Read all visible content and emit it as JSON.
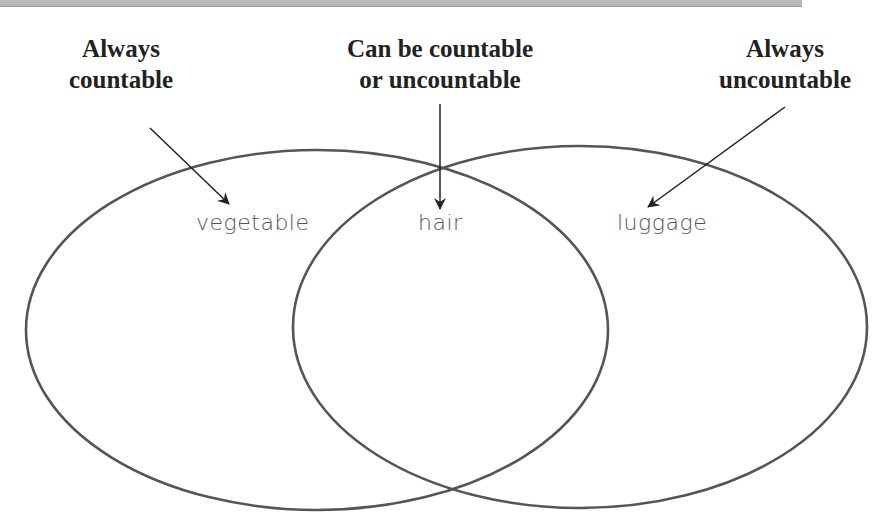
{
  "diagram": {
    "type": "venn",
    "headings": {
      "left": {
        "line1": "Always",
        "line2": "countable"
      },
      "middle": {
        "line1": "Can be countable",
        "line2": "or uncountable"
      },
      "right": {
        "line1": "Always",
        "line2": "uncountable"
      }
    },
    "labels": {
      "left": "vegetable",
      "middle": "hair",
      "right": "luggage"
    },
    "colors": {
      "circle_stroke": "#555555",
      "arrow": "#222222",
      "heading_text": "#222222",
      "label_text": "#555555",
      "top_band": "#b9b9b9"
    }
  }
}
